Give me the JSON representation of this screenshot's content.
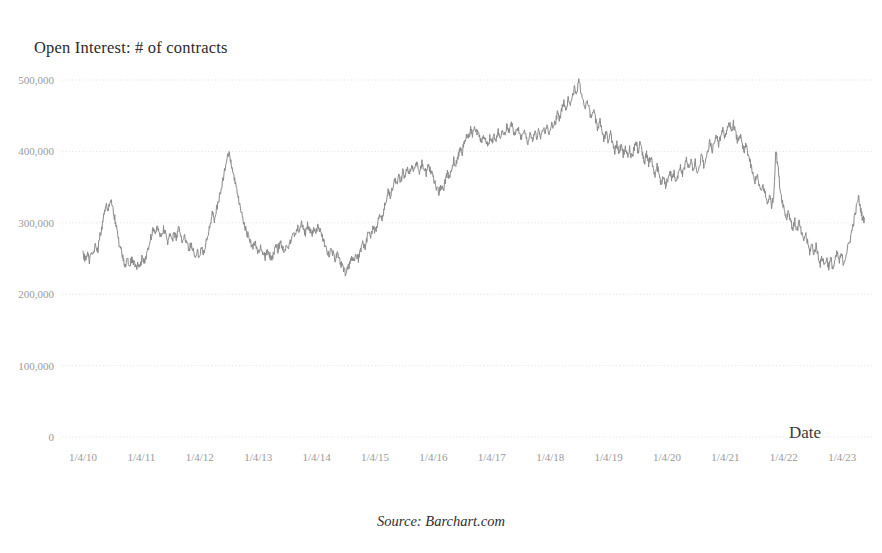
{
  "chart_data": {
    "type": "line",
    "title": "Open Interest: # of contracts",
    "xlabel": "Date",
    "ylabel": "",
    "source_note": "Source: Barchart.com",
    "grid": true,
    "legend": "none",
    "line_color": "#8a8a8a",
    "background_color": "#ffffff",
    "tick_color": "#9a9a9a",
    "ylim": [
      0,
      500000
    ],
    "yticks": [
      0,
      100000,
      200000,
      300000,
      400000,
      500000
    ],
    "ytick_labels": [
      "0",
      "100,000",
      "200,000",
      "300,000",
      "400,000",
      "500,000"
    ],
    "xtick_labels": [
      "1/4/10",
      "1/4/11",
      "1/4/12",
      "1/4/13",
      "1/4/14",
      "1/4/15",
      "1/4/16",
      "1/4/17",
      "1/4/18",
      "1/4/19",
      "1/4/20",
      "1/4/21",
      "1/4/22",
      "1/4/23"
    ],
    "xlim": [
      "1/4/10",
      "1/4/23"
    ],
    "series_name": "Open Interest",
    "x_start_year": 2010.0,
    "x_end_year": 2023.3,
    "values": [
      255000,
      249000,
      258000,
      247000,
      262000,
      256000,
      270000,
      262000,
      281000,
      296000,
      312000,
      327000,
      318000,
      331000,
      322000,
      306000,
      288000,
      272000,
      262000,
      248000,
      239000,
      247000,
      238000,
      251000,
      243000,
      236000,
      245000,
      240000,
      252000,
      244000,
      256000,
      268000,
      279000,
      291000,
      284000,
      296000,
      288000,
      281000,
      292000,
      286000,
      274000,
      283000,
      272000,
      287000,
      278000,
      292000,
      284000,
      273000,
      281000,
      270000,
      262000,
      271000,
      260000,
      252000,
      261000,
      253000,
      266000,
      258000,
      272000,
      285000,
      299000,
      312000,
      305000,
      318000,
      331000,
      345000,
      360000,
      375000,
      390000,
      396000,
      382000,
      368000,
      352000,
      338000,
      324000,
      311000,
      298000,
      290000,
      281000,
      273000,
      265000,
      272000,
      264000,
      258000,
      266000,
      259000,
      252000,
      261000,
      255000,
      248000,
      257000,
      268000,
      262000,
      273000,
      267000,
      259000,
      270000,
      263000,
      275000,
      288000,
      281000,
      295000,
      288000,
      300000,
      293000,
      285000,
      297000,
      290000,
      282000,
      293000,
      285000,
      296000,
      288000,
      279000,
      270000,
      262000,
      255000,
      264000,
      256000,
      248000,
      257000,
      249000,
      241000,
      234000,
      228000,
      236000,
      243000,
      252000,
      245000,
      256000,
      249000,
      260000,
      272000,
      265000,
      277000,
      289000,
      282000,
      294000,
      288000,
      300000,
      312000,
      305000,
      318000,
      330000,
      343000,
      336000,
      348000,
      361000,
      354000,
      366000,
      359000,
      371000,
      364000,
      376000,
      369000,
      381000,
      374000,
      386000,
      379000,
      371000,
      383000,
      376000,
      368000,
      380000,
      373000,
      365000,
      357000,
      349000,
      341000,
      352000,
      346000,
      358000,
      370000,
      363000,
      375000,
      388000,
      381000,
      393000,
      406000,
      399000,
      412000,
      424000,
      417000,
      430000,
      423000,
      435000,
      428000,
      420000,
      412000,
      424000,
      416000,
      408000,
      419000,
      411000,
      423000,
      415000,
      427000,
      419000,
      431000,
      423000,
      435000,
      427000,
      439000,
      431000,
      423000,
      434000,
      426000,
      418000,
      429000,
      421000,
      413000,
      424000,
      416000,
      427000,
      419000,
      430000,
      422000,
      433000,
      425000,
      436000,
      428000,
      439000,
      431000,
      442000,
      454000,
      446000,
      458000,
      469000,
      461000,
      472000,
      464000,
      476000,
      488000,
      480000,
      499000,
      486000,
      473000,
      460000,
      471000,
      458000,
      445000,
      457000,
      444000,
      431000,
      442000,
      429000,
      416000,
      427000,
      414000,
      425000,
      412000,
      399000,
      410000,
      397000,
      408000,
      395000,
      406000,
      393000,
      404000,
      391000,
      402000,
      413000,
      400000,
      411000,
      398000,
      385000,
      396000,
      383000,
      394000,
      381000,
      368000,
      379000,
      366000,
      353000,
      364000,
      351000,
      362000,
      373000,
      360000,
      371000,
      358000,
      369000,
      380000,
      367000,
      378000,
      389000,
      376000,
      387000,
      374000,
      385000,
      372000,
      383000,
      394000,
      381000,
      392000,
      403000,
      414000,
      401000,
      412000,
      423000,
      410000,
      421000,
      432000,
      419000,
      430000,
      441000,
      428000,
      439000,
      426000,
      413000,
      424000,
      411000,
      398000,
      409000,
      396000,
      383000,
      370000,
      357000,
      368000,
      355000,
      342000,
      353000,
      340000,
      327000,
      338000,
      325000,
      336000,
      402000,
      380000,
      348000,
      332000,
      319000,
      306000,
      317000,
      304000,
      291000,
      302000,
      289000,
      300000,
      287000,
      274000,
      285000,
      272000,
      259000,
      270000,
      257000,
      268000,
      255000,
      242000,
      253000,
      240000,
      251000,
      238000,
      249000,
      236000,
      247000,
      258000,
      245000,
      256000,
      243000,
      254000,
      265000,
      276000,
      290000,
      305000,
      320000,
      336000,
      320000,
      305000
    ]
  }
}
